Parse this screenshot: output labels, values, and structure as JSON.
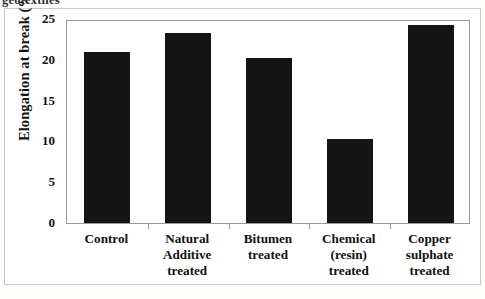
{
  "page": {
    "running_header": "geotextiles"
  },
  "chart_data": {
    "type": "bar",
    "title": "",
    "subtitle": "",
    "xlabel": "",
    "ylabel": "Elongation at break (%)",
    "categories": [
      "Control",
      "Natural Additive treated",
      "Bitumen treated",
      "Chemical (resin) treated",
      "Copper sulphate treated"
    ],
    "category_lines": [
      [
        "Control"
      ],
      [
        "Natural",
        "Additive",
        "treated"
      ],
      [
        "Bitumen",
        "treated"
      ],
      [
        "Chemical",
        "(resin)",
        "treated"
      ],
      [
        "Copper",
        "sulphate",
        "treated"
      ]
    ],
    "values": [
      21.0,
      23.3,
      20.2,
      10.3,
      24.3
    ],
    "ylim": [
      0,
      25
    ],
    "ytick_labels": [
      "0",
      "5",
      "10",
      "15",
      "20",
      "25"
    ],
    "ytick_values": [
      0,
      5,
      10,
      15,
      20,
      25
    ],
    "grid": false,
    "legend": "none",
    "bar_color": "#141414",
    "axis_color": "#9a9a9a",
    "text_color": "#111111"
  }
}
